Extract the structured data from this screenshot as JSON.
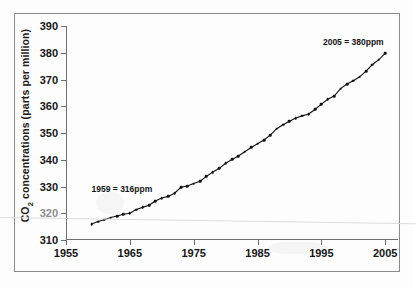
{
  "chart_data": {
    "type": "line",
    "title": "",
    "xlabel": "",
    "ylabel": "CO2 concentrations (parts per million)",
    "ylabel_display": "CO₂ concentrations (parts per million)",
    "xlim": [
      1955,
      2007
    ],
    "ylim": [
      310,
      390
    ],
    "xticks": [
      1955,
      1965,
      1975,
      1985,
      1995,
      2005
    ],
    "yticks": [
      310,
      320,
      330,
      340,
      350,
      360,
      370,
      380,
      390
    ],
    "grid": false,
    "legend": "none",
    "marker": "filled-circle",
    "line_color": "#111111",
    "series": [
      {
        "name": "Mauna Loa atmospheric CO2",
        "x": [
          1959,
          1960,
          1961,
          1962,
          1963,
          1964,
          1965,
          1966,
          1967,
          1968,
          1969,
          1970,
          1971,
          1972,
          1973,
          1974,
          1975,
          1976,
          1977,
          1978,
          1979,
          1980,
          1981,
          1982,
          1983,
          1984,
          1985,
          1986,
          1987,
          1988,
          1989,
          1990,
          1991,
          1992,
          1993,
          1994,
          1995,
          1996,
          1997,
          1998,
          1999,
          2000,
          2001,
          2002,
          2003,
          2004,
          2005
        ],
        "values": [
          316.0,
          316.9,
          317.6,
          318.4,
          319.0,
          319.6,
          320.0,
          321.4,
          322.2,
          323.0,
          324.6,
          325.7,
          326.3,
          327.5,
          329.7,
          330.2,
          331.1,
          332.0,
          333.8,
          335.4,
          336.8,
          338.7,
          340.1,
          341.4,
          343.0,
          344.6,
          346.0,
          347.4,
          349.2,
          351.6,
          353.1,
          354.4,
          355.6,
          356.4,
          357.1,
          358.8,
          360.8,
          362.6,
          363.8,
          366.6,
          368.3,
          369.5,
          371.0,
          373.1,
          375.6,
          377.4,
          379.8
        ]
      }
    ],
    "annotations": [
      {
        "id": "start-annotation",
        "text": "1959 = 316ppm",
        "x": 1959,
        "y": 331
      },
      {
        "id": "end-annotation",
        "text": "2005 = 380ppm",
        "x": 2000,
        "y": 384
      }
    ]
  }
}
